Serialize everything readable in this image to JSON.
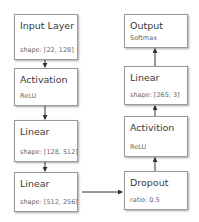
{
  "diagram": {
    "nodes": [
      {
        "id": "input",
        "title": "Input Layer",
        "sub": "shape: [22, 128]"
      },
      {
        "id": "act1",
        "title": "Activation",
        "sub": "ReLU"
      },
      {
        "id": "lin1",
        "title": "Linear",
        "sub": "shape: [128, 512]"
      },
      {
        "id": "lin2",
        "title": "Linear",
        "sub": "shape: [512, 256]"
      },
      {
        "id": "dropout",
        "title": "Dropout",
        "sub": "ratio: 0.5"
      },
      {
        "id": "act2",
        "title": "Activition",
        "sub": "ReLU"
      },
      {
        "id": "lin3",
        "title": "Linear",
        "sub": "shape: [265, 3]"
      },
      {
        "id": "output",
        "title": "Output",
        "sub": "Softmax"
      }
    ],
    "edges": [
      [
        "input",
        "act1"
      ],
      [
        "act1",
        "lin1"
      ],
      [
        "lin1",
        "lin2"
      ],
      [
        "lin2",
        "dropout"
      ],
      [
        "dropout",
        "act2"
      ],
      [
        "act2",
        "lin3"
      ],
      [
        "lin3",
        "output"
      ]
    ],
    "colors": {
      "border": "#9a9a9a",
      "text": "#3a3a3a",
      "subtext": "#666666",
      "edge": "#333333"
    }
  }
}
